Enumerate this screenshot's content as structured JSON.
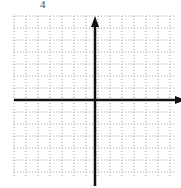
{
  "figure": {
    "problem_number": "4",
    "grid": {
      "left": 14,
      "top": 16,
      "right": 174,
      "bottom": 178,
      "spacing": 12,
      "line_color": "#9a9a9a",
      "line_style": "dotted"
    },
    "axes": {
      "x_axis_y": 100,
      "y_axis_x": 95,
      "color": "#111111",
      "x_arrow": "right",
      "y_arrow": "up"
    }
  }
}
